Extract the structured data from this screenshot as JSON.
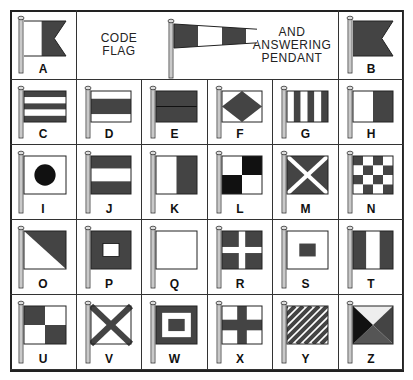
{
  "title_left": [
    "CODE",
    "FLAG"
  ],
  "title_right": [
    "AND",
    "ANSWERING",
    "PENDANT"
  ],
  "colors": {
    "dark": "#444444",
    "black": "#111111",
    "light": "#ffffff",
    "pole": "#dddddd",
    "line": "#333333"
  },
  "flags": [
    {
      "letter": "A",
      "design": "swallowtail white-hoist dark-fly"
    },
    {
      "letter": "B",
      "design": "swallowtail solid dark"
    },
    {
      "letter": "C",
      "design": "horizontal stripes dark-white-dark-white-dark"
    },
    {
      "letter": "D",
      "design": "horizontal stripes white-dark-white"
    },
    {
      "letter": "E",
      "design": "horizontal halves dark-dark"
    },
    {
      "letter": "F",
      "design": "dark diamond on white"
    },
    {
      "letter": "G",
      "design": "vertical stripes"
    },
    {
      "letter": "H",
      "design": "vertical halves white-dark"
    },
    {
      "letter": "I",
      "design": "black circle on white"
    },
    {
      "letter": "J",
      "design": "horizontal stripes dark-white-dark"
    },
    {
      "letter": "K",
      "design": "vertical halves white-dark"
    },
    {
      "letter": "L",
      "design": "quarters white-black/black-white"
    },
    {
      "letter": "M",
      "design": "white saltire on dark"
    },
    {
      "letter": "N",
      "design": "checkerboard"
    },
    {
      "letter": "O",
      "design": "diagonal dark upper / white lower"
    },
    {
      "letter": "P",
      "design": "dark with white center"
    },
    {
      "letter": "Q",
      "design": "plain white"
    },
    {
      "letter": "R",
      "design": "white cross on dark"
    },
    {
      "letter": "S",
      "design": "dark center on white"
    },
    {
      "letter": "T",
      "design": "vertical tricolor dark-white-dark"
    },
    {
      "letter": "U",
      "design": "quarters dark-white/white-dark"
    },
    {
      "letter": "V",
      "design": "dark saltire on white"
    },
    {
      "letter": "W",
      "design": "dark border white frame dark center"
    },
    {
      "letter": "X",
      "design": "dark cross on white"
    },
    {
      "letter": "Y",
      "design": "diagonal stripes"
    },
    {
      "letter": "Z",
      "design": "four triangles"
    }
  ],
  "pendant": {
    "label": "code flag and answering pendant",
    "design": "tapered stripes dark-white-dark-white-dark"
  }
}
